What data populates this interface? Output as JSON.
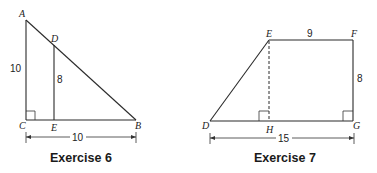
{
  "figures": [
    {
      "caption": "Exercise 6",
      "points": {
        "A": "A",
        "B": "B",
        "C": "C",
        "D": "D",
        "E": "E"
      },
      "labels": {
        "AC": "10",
        "DE": "8",
        "CB": "10"
      }
    },
    {
      "caption": "Exercise 7",
      "points": {
        "D": "D",
        "E": "E",
        "F": "F",
        "G": "G",
        "H": "H"
      },
      "labels": {
        "EF": "9",
        "FG": "8",
        "DG": "15"
      }
    }
  ]
}
